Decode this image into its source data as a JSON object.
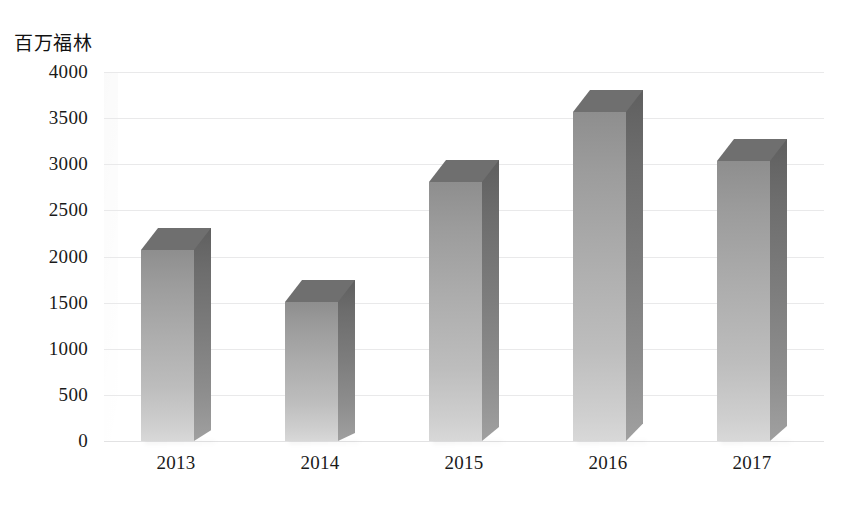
{
  "chart_data": {
    "type": "bar",
    "title": "",
    "subtitle": "",
    "xlabel": "",
    "ylabel": "百万福林",
    "categories": [
      "2013",
      "2014",
      "2015",
      "2016",
      "2017"
    ],
    "values": [
      2070,
      1510,
      2810,
      3570,
      3040
    ],
    "series": [
      {
        "name": "",
        "values": [
          2070,
          1510,
          2810,
          3570,
          3040
        ]
      }
    ],
    "ylim": [
      0,
      4000
    ],
    "ytick_labels": [
      "4000",
      "3500",
      "3000",
      "2500",
      "2000",
      "1500",
      "1000",
      "500",
      "0"
    ],
    "ytick_values": [
      4000,
      3500,
      3000,
      2500,
      2000,
      1500,
      1000,
      500,
      0
    ],
    "xtick_labels": [
      "2013",
      "2014",
      "2015",
      "2016",
      "2017"
    ],
    "grid": true,
    "grid_axis": "y",
    "legend": false,
    "legend_position": "none",
    "style": "3d-column",
    "bar_color_top": "#8e8e8e",
    "bar_color_bottom": "#d8d8d8",
    "bar_side_color": "#6d6d6d",
    "bar_top_color": "#6f6f6f",
    "gridline_color": "#e9e9ea",
    "background_color": "#ffffff",
    "text_color": "#1a1a1a",
    "annotations": []
  },
  "axis": {
    "y_unit_label": "百万福林"
  },
  "footer": {
    "caption": ""
  }
}
